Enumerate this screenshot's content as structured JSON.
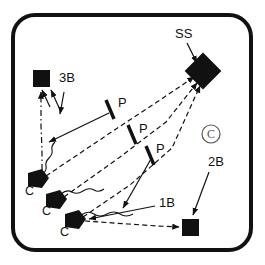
{
  "diagram": {
    "frame": {
      "stroke_color": "#111111",
      "stroke_width": 4,
      "corner_radius": 22,
      "x": 13,
      "y": 15,
      "width": 238,
      "height": 235
    },
    "ink_color": "#111111",
    "labels": [
      {
        "id": "ss",
        "text": "SS",
        "x": 175,
        "y": 34
      },
      {
        "id": "3b",
        "text": "3B",
        "x": 59,
        "y": 78
      },
      {
        "id": "p1",
        "text": "P",
        "x": 118,
        "y": 103
      },
      {
        "id": "p2",
        "text": "P",
        "x": 139,
        "y": 129
      },
      {
        "id": "p3",
        "text": "P",
        "x": 156,
        "y": 149
      },
      {
        "id": "2b",
        "text": "2B",
        "x": 208,
        "y": 162
      },
      {
        "id": "1b",
        "text": "1B",
        "x": 159,
        "y": 203
      },
      {
        "id": "c1",
        "text": "C",
        "x": 25,
        "y": 191
      },
      {
        "id": "c2",
        "text": "C",
        "x": 42,
        "y": 211
      },
      {
        "id": "c3",
        "text": "C",
        "x": 60,
        "y": 232
      },
      {
        "id": "copyright",
        "text": "©",
        "x": 205,
        "y": 129
      }
    ],
    "markers": {
      "bases": [
        {
          "id": "base-3b",
          "shape": "square",
          "cx": 41,
          "cy": 78,
          "size": 16
        },
        {
          "id": "base-2b",
          "shape": "square",
          "cx": 190,
          "cy": 227,
          "size": 16
        },
        {
          "id": "base-ss",
          "shape": "diamond",
          "cx": 203,
          "cy": 71,
          "size": 19
        }
      ],
      "catchers": [
        {
          "id": "catcher-1",
          "shape": "home-plate",
          "cx": 37,
          "cy": 180
        },
        {
          "id": "catcher-2",
          "shape": "home-plate",
          "cx": 55,
          "cy": 201
        },
        {
          "id": "catcher-3",
          "shape": "home-plate",
          "cx": 74,
          "cy": 221
        }
      ],
      "pitcher_screens": [
        {
          "id": "screen-1",
          "x1": 106,
          "y1": 100,
          "x2": 114,
          "y2": 118
        },
        {
          "id": "screen-2",
          "x1": 128,
          "y1": 125,
          "x2": 136,
          "y2": 143
        },
        {
          "id": "screen-3",
          "x1": 146,
          "y1": 146,
          "x2": 154,
          "y2": 164
        }
      ]
    },
    "paths": {
      "throws_dashed": [
        {
          "id": "throw-c1-to-3b",
          "style": "dash-dot",
          "points": "42,170 42,150 41,126 41,92"
        },
        {
          "id": "throw-c1-to-ss",
          "style": "dashed",
          "points": "46,176 110,133 160,100 196,78"
        },
        {
          "id": "throw-c2-to-ss",
          "style": "dashed",
          "points": "64,197 120,157 165,124 197,82"
        },
        {
          "id": "throw-c3-to-ss",
          "style": "dashed",
          "points": "83,217 130,185 170,150 199,85"
        },
        {
          "id": "throw-c3-to-2b",
          "style": "dashed",
          "points": "85,220 130,224 160,226 180,227"
        }
      ],
      "runner_wavy": [
        {
          "id": "run-c1",
          "points": "43,175 46,168 42,161 47,154 43,147 46,140"
        },
        {
          "id": "run-c2",
          "points": "62,194 70,189 78,193 86,187 94,191 102,186"
        },
        {
          "id": "run-c3",
          "points": "82,215 92,211 101,215 110,210 119,214 128,209 137,213"
        }
      ],
      "pointer_arrows": [
        {
          "id": "arrow-ss-to-base",
          "x1": 188,
          "y1": 44,
          "x2": 197,
          "y2": 63
        },
        {
          "id": "arrow-3b-a",
          "x1": 49,
          "y1": 106,
          "x2": 41,
          "y2": 90
        },
        {
          "id": "arrow-3b-b",
          "x1": 58,
          "y1": 111,
          "x2": 50,
          "y2": 91
        },
        {
          "id": "arrow-3b-c",
          "x1": 64,
          "y1": 114,
          "x2": 59,
          "y2": 92
        },
        {
          "id": "arrow-screen1-left",
          "x1": 108,
          "y1": 112,
          "x2": 48,
          "y2": 142
        },
        {
          "id": "arrow-screen3-left",
          "x1": 150,
          "y1": 158,
          "x2": 122,
          "y2": 209
        },
        {
          "id": "arrow-1b-left",
          "x1": 153,
          "y1": 206,
          "x2": 88,
          "y2": 219
        },
        {
          "id": "arrow-2b-to-base",
          "x1": 208,
          "y1": 172,
          "x2": 192,
          "y2": 216
        }
      ]
    }
  }
}
